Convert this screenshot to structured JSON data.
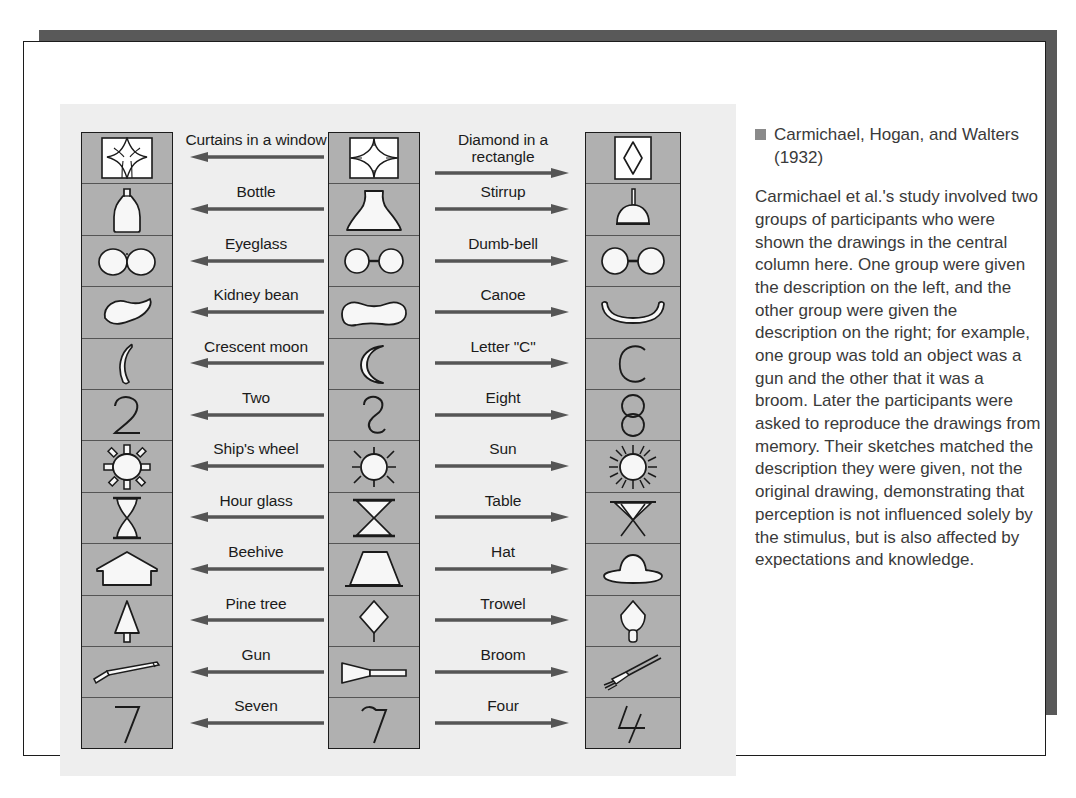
{
  "figure": {
    "columns": {
      "left_label": "left reproduction column",
      "middle_label": "original stimulus column",
      "right_label": "right reproduction column"
    },
    "rows": [
      {
        "left_word": "Curtains in a window",
        "right_word": "Diamond in a rectangle",
        "left_icon": "curtains-in-a-window-icon",
        "mid_icon": "diamond-in-square-icon",
        "right_icon": "diamond-in-rectangle-icon"
      },
      {
        "left_word": "Bottle",
        "right_word": "Stirrup",
        "left_icon": "bottle-icon",
        "mid_icon": "flask-shape-icon",
        "right_icon": "stirrup-icon"
      },
      {
        "left_word": "Eyeglass",
        "right_word": "Dumb-bell",
        "left_icon": "eyeglass-icon",
        "mid_icon": "two-circles-bar-icon",
        "right_icon": "dumbbell-icon"
      },
      {
        "left_word": "Kidney bean",
        "right_word": "Canoe",
        "left_icon": "kidney-bean-icon",
        "mid_icon": "bean-shape-icon",
        "right_icon": "canoe-icon"
      },
      {
        "left_word": "Crescent moon",
        "right_word": "Letter \"C\"",
        "left_icon": "crescent-moon-icon",
        "mid_icon": "crescent-shape-icon",
        "right_icon": "letter-c-icon"
      },
      {
        "left_word": "Two",
        "right_word": "Eight",
        "left_icon": "digit-two-icon",
        "mid_icon": "curvy-two-shape-icon",
        "right_icon": "digit-eight-icon"
      },
      {
        "left_word": "Ship's wheel",
        "right_word": "Sun",
        "left_icon": "ships-wheel-icon",
        "mid_icon": "circle-with-spokes-icon",
        "right_icon": "sun-icon"
      },
      {
        "left_word": "Hour glass",
        "right_word": "Table",
        "left_icon": "hour-glass-icon",
        "mid_icon": "hourglass-shape-icon",
        "right_icon": "table-icon"
      },
      {
        "left_word": "Beehive",
        "right_word": "Hat",
        "left_icon": "beehive-icon",
        "mid_icon": "trapezoid-shape-icon",
        "right_icon": "hat-icon"
      },
      {
        "left_word": "Pine tree",
        "right_word": "Trowel",
        "left_icon": "pine-tree-icon",
        "mid_icon": "diamond-with-stem-icon",
        "right_icon": "trowel-icon"
      },
      {
        "left_word": "Gun",
        "right_word": "Broom",
        "left_icon": "gun-icon",
        "mid_icon": "wedge-with-handle-icon",
        "right_icon": "broom-icon"
      },
      {
        "left_word": "Seven",
        "right_word": "Four",
        "left_icon": "digit-seven-icon",
        "mid_icon": "seven-shape-icon",
        "right_icon": "digit-four-icon"
      }
    ],
    "arrows": {
      "left_direction": "left-arrow-icon",
      "right_direction": "right-arrow-icon"
    }
  },
  "caption": {
    "heading": "Carmichael, Hogan, and Walters (1932)",
    "bullet_icon": "square-bullet-icon",
    "body": "Carmichael et al.'s study involved two groups of participants who were shown the drawings in the central column here. One group were given the description on the left, and the other group were given the description on the right; for example, one group was told an object was a gun and the other that it was a broom. Later the participants were asked to reproduce the drawings from memory. Their sketches matched the description they were given, not the original drawing, demonstrating that perception is not influenced solely by the stimulus, but is also affected by expectations and knowledge."
  },
  "colors": {
    "cell_fill": "#b0b0b0",
    "panel_fill": "#eeeeee",
    "ink": "#1b1b1b",
    "shadow": "#595959",
    "caption_text": "#3a3a3a"
  }
}
